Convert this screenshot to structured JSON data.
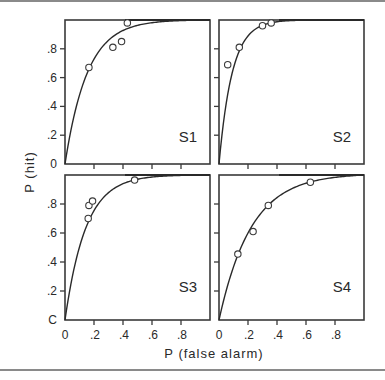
{
  "chart_data": {
    "type": "scatter",
    "title": "",
    "xlabel": "P (false alarm)",
    "ylabel": "P (hit)",
    "xlim": [
      0,
      1
    ],
    "ylim": [
      0,
      1
    ],
    "grid": false,
    "x_ticks": [
      "0",
      ".2",
      ".4",
      ".6",
      ".8"
    ],
    "y_ticks": [
      "C",
      ".2",
      ".4",
      ".6",
      ".8"
    ],
    "panels": [
      {
        "name": "S1",
        "points": [
          {
            "x": 0.165,
            "y": 0.67
          },
          {
            "x": 0.33,
            "y": 0.81
          },
          {
            "x": 0.39,
            "y": 0.85
          },
          {
            "x": 0.43,
            "y": 0.98
          }
        ],
        "curve_k": 6.5
      },
      {
        "name": "S2",
        "points": [
          {
            "x": 0.06,
            "y": 0.69
          },
          {
            "x": 0.14,
            "y": 0.81
          },
          {
            "x": 0.3,
            "y": 0.96
          },
          {
            "x": 0.36,
            "y": 0.98
          }
        ],
        "curve_k": 11
      },
      {
        "name": "S3",
        "points": [
          {
            "x": 0.16,
            "y": 0.7
          },
          {
            "x": 0.165,
            "y": 0.79
          },
          {
            "x": 0.19,
            "y": 0.82
          },
          {
            "x": 0.48,
            "y": 0.965
          }
        ],
        "curve_k": 7
      },
      {
        "name": "S4",
        "points": [
          {
            "x": 0.13,
            "y": 0.455
          },
          {
            "x": 0.235,
            "y": 0.61
          },
          {
            "x": 0.34,
            "y": 0.79
          },
          {
            "x": 0.63,
            "y": 0.95
          }
        ],
        "curve_k": 4.5
      }
    ]
  },
  "labels": {
    "xlabel": "P (false alarm)",
    "ylabel": "P (hit)",
    "panel_names": [
      "S1",
      "S2",
      "S3",
      "S4"
    ]
  }
}
